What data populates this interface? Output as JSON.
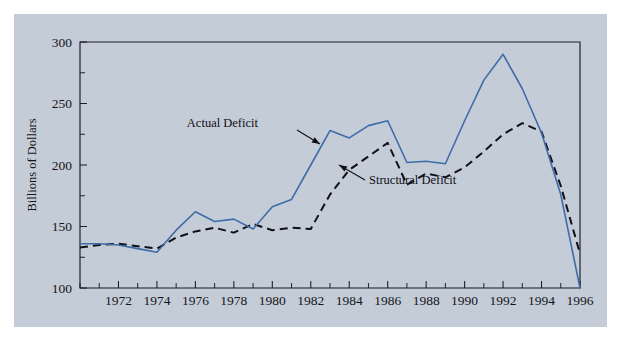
{
  "figure": {
    "background_color": "#ffffff",
    "panel_color": "#c4ccd8"
  },
  "chart_data": {
    "type": "line",
    "title": "",
    "subtitle": "",
    "xlabel": "",
    "ylabel": "Billions of Dollars",
    "xlim": [
      1970,
      1996
    ],
    "ylim": [
      100,
      300
    ],
    "grid": false,
    "legend_position": "inline-annotations",
    "y_ticks": [
      100,
      150,
      200,
      250,
      300
    ],
    "y_tick_labels": [
      "100",
      "150",
      "200",
      "250",
      "300"
    ],
    "y_minor_ticks": [
      125,
      175,
      225,
      275
    ],
    "x_ticks": [
      1970,
      1971,
      1972,
      1973,
      1974,
      1975,
      1976,
      1977,
      1978,
      1979,
      1980,
      1981,
      1982,
      1983,
      1984,
      1985,
      1986,
      1987,
      1988,
      1989,
      1990,
      1991,
      1992,
      1993,
      1994,
      1995,
      1996
    ],
    "x_tick_labels": [
      "1972",
      "1974",
      "1976",
      "1978",
      "1980",
      "1982",
      "1984",
      "1986",
      "1988",
      "1990",
      "1992",
      "1994",
      "1996"
    ],
    "x_labeled_ticks": [
      1972,
      1974,
      1976,
      1978,
      1980,
      1982,
      1984,
      1986,
      1988,
      1990,
      1992,
      1994,
      1996
    ],
    "x": [
      1970,
      1971,
      1972,
      1973,
      1974,
      1975,
      1976,
      1977,
      1978,
      1979,
      1980,
      1981,
      1982,
      1983,
      1984,
      1985,
      1986,
      1987,
      1988,
      1989,
      1990,
      1991,
      1992,
      1993,
      1994,
      1995,
      1996
    ],
    "series": [
      {
        "name": "Actual Deficit",
        "color": "#3e6ca8",
        "style": "solid",
        "values": [
          136,
          136,
          135,
          132,
          129,
          147,
          162,
          154,
          156,
          148,
          166,
          172,
          200,
          228,
          222,
          232,
          236,
          202,
          203,
          201,
          236,
          269,
          290,
          262,
          226,
          176,
          100
        ]
      },
      {
        "name": "Structural Deficit",
        "color": "#101014",
        "style": "dashed",
        "values": [
          133,
          135,
          136,
          134,
          132,
          141,
          146,
          149,
          145,
          152,
          147,
          149,
          148,
          176,
          196,
          207,
          218,
          184,
          193,
          190,
          198,
          211,
          225,
          234,
          227,
          183,
          128
        ]
      }
    ],
    "annotations": [
      {
        "text": "Actual Deficit",
        "points_to_series": "Actual Deficit",
        "label_x": 258,
        "label_y": 127,
        "arrow_from_x": 297,
        "arrow_from_y": 130,
        "arrow_to_x": 320,
        "arrow_to_y": 144
      },
      {
        "text": "Structural Deficit",
        "points_to_series": "Structural Deficit",
        "label_x": 369,
        "label_y": 184,
        "arrow_from_x": 365,
        "arrow_from_y": 180,
        "arrow_to_x": 339,
        "arrow_to_y": 165
      }
    ]
  },
  "plot_geometry": {
    "left": 80,
    "right": 580,
    "top": 42,
    "bottom": 288
  }
}
